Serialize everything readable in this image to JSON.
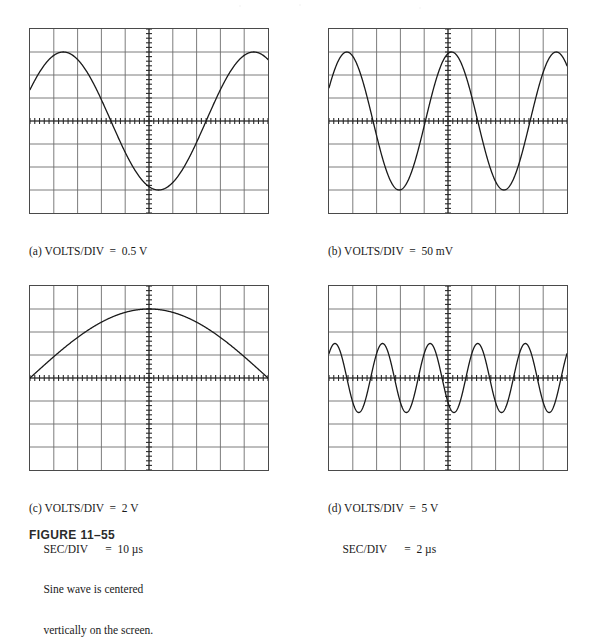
{
  "figure": {
    "label": "FIGURE 11–55"
  },
  "scope": {
    "divisions_x": 10,
    "divisions_y": 8,
    "grid_color": "#6e6e6e",
    "border_color": "#4a4a4a",
    "trace_color": "#1a1a1a",
    "axis_minor_ticks_per_div": 5
  },
  "panels": [
    {
      "id": "a",
      "tag": "(a)",
      "caption_lines": [
        "(a) VOLTS/DIV  =  0.5 V",
        "     SEC/DIV      =  2 ms"
      ],
      "settings": {
        "volts_per_div_label": "VOLTS/DIV",
        "volts_per_div_value": "0.5 V",
        "sec_per_div_label": "SEC/DIV",
        "sec_per_div_value": "2 ms"
      },
      "waveform": {
        "type": "sine",
        "amplitude_div": 3.0,
        "period_div": 8.0,
        "phase_div": 0.6,
        "cycles_visible": 1.25,
        "offset_div": 0.0
      }
    },
    {
      "id": "b",
      "tag": "(b)",
      "caption_lines": [
        "(b) VOLTS/DIV  =  50 mV",
        "     SEC/DIV      =  0.1 ms"
      ],
      "settings": {
        "volts_per_div_label": "VOLTS/DIV",
        "volts_per_div_value": "50 mV",
        "sec_per_div_label": "SEC/DIV",
        "sec_per_div_value": "0.1 ms"
      },
      "waveform": {
        "type": "sine",
        "amplitude_div": 3.0,
        "period_div": 4.4,
        "phase_div": 0.35,
        "cycles_visible": 2.25,
        "offset_div": 0.0
      }
    },
    {
      "id": "c",
      "tag": "(c)",
      "caption_lines": [
        "(c) VOLTS/DIV  =  2 V",
        "     SEC/DIV      =  10 µs",
        "     Sine wave is centered",
        "     vertically on the screen."
      ],
      "settings": {
        "volts_per_div_label": "VOLTS/DIV",
        "volts_per_div_value": "2 V",
        "sec_per_div_label": "SEC/DIV",
        "sec_per_div_value": "10 µs",
        "note": "Sine wave is centered vertically on the screen."
      },
      "waveform": {
        "type": "sine",
        "amplitude_div": 3.0,
        "period_div": 20.0,
        "phase_div": 0.0,
        "cycles_visible": 0.5,
        "offset_div": 0.0
      }
    },
    {
      "id": "d",
      "tag": "(d)",
      "caption_lines": [
        "(d) VOLTS/DIV  =  5 V",
        "     SEC/DIV      =  2 µs"
      ],
      "settings": {
        "volts_per_div_label": "VOLTS/DIV",
        "volts_per_div_value": "5 V",
        "sec_per_div_label": "SEC/DIV",
        "sec_per_div_value": "2 µs"
      },
      "waveform": {
        "type": "sine",
        "amplitude_div": 1.5,
        "period_div": 2.0,
        "phase_div": 0.25,
        "cycles_visible": 5.0,
        "offset_div": 0.0
      }
    }
  ]
}
